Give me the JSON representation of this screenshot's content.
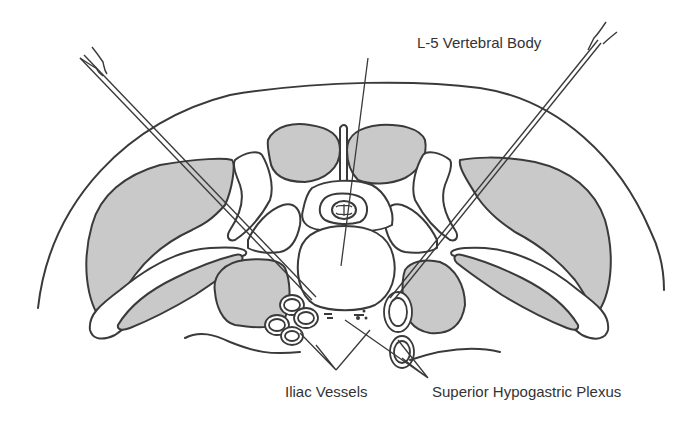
{
  "diagram": {
    "labels": {
      "vertebral_body": "L-5 Vertebral Body",
      "iliac_vessels": "Iliac Vessels",
      "hypogastric_plexus": "Superior Hypogastric Plexus"
    },
    "colors": {
      "line": "#3a3a3a",
      "muscle_fill": "#c9c9c9",
      "background": "#ffffff",
      "text": "#333333"
    },
    "structures": [
      "body-wall-outline",
      "left-paraspinal-muscle",
      "right-paraspinal-muscle",
      "left-psoas-muscle",
      "right-psoas-muscle",
      "left-iliacus-muscle",
      "right-iliacus-muscle",
      "spinous-process-muscles",
      "vertebral-body",
      "spinal-canal",
      "spinal-cord",
      "left-transverse-process",
      "right-transverse-process",
      "left-needle",
      "right-needle",
      "iliac-vessels",
      "hypogastric-plexus"
    ]
  }
}
